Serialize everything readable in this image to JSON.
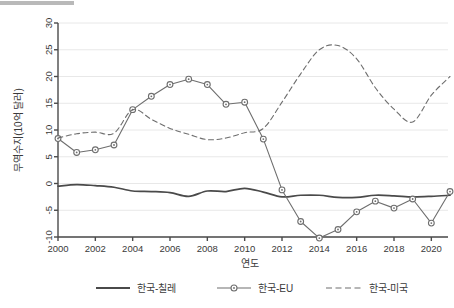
{
  "chart_data": {
    "type": "line",
    "title": "",
    "xlabel": "연도",
    "ylabel": "무역수지(10억 달러)",
    "xlim": [
      2000,
      2021
    ],
    "ylim": [
      -10,
      30
    ],
    "grid": true,
    "grid_axis": "y",
    "legend_position": "bottom",
    "x": [
      2000,
      2001,
      2002,
      2003,
      2004,
      2005,
      2006,
      2007,
      2008,
      2009,
      2010,
      2011,
      2012,
      2013,
      2014,
      2015,
      2016,
      2017,
      2018,
      2019,
      2020,
      2021
    ],
    "xticks": [
      "2000",
      "2002",
      "2004",
      "2006",
      "2008",
      "2010",
      "2012",
      "2014",
      "2016",
      "2018",
      "2020"
    ],
    "xtick_values": [
      2000,
      2002,
      2004,
      2006,
      2008,
      2010,
      2012,
      2014,
      2016,
      2018,
      2020
    ],
    "yticks": [
      "30",
      "25",
      "20",
      "15",
      "10",
      "5",
      "0",
      "-5",
      "-10"
    ],
    "ytick_values": [
      30,
      25,
      20,
      15,
      10,
      5,
      0,
      -5,
      -10
    ],
    "series": [
      {
        "name": "한국-칠레",
        "style": "solid",
        "marker": "none",
        "color": "#4a4a4a",
        "values": [
          -0.5,
          -0.2,
          -0.4,
          -0.7,
          -1.4,
          -1.5,
          -1.7,
          -2.4,
          -1.4,
          -1.5,
          -0.9,
          -1.6,
          -2.5,
          -2.2,
          -2.2,
          -2.6,
          -2.6,
          -2.2,
          -2.3,
          -2.5,
          -2.4,
          -2.2
        ]
      },
      {
        "name": "한국-EU",
        "style": "solid",
        "marker": "circle",
        "color": "#6e6e6e",
        "values": [
          8.4,
          5.8,
          6.3,
          7.2,
          13.8,
          16.3,
          18.5,
          19.5,
          18.5,
          14.8,
          15.2,
          8.3,
          -1.2,
          -7.1,
          -10.2,
          -8.6,
          -5.3,
          -3.3,
          -4.6,
          -2.9,
          -7.4,
          -1.5
        ]
      },
      {
        "name": "한국-미국",
        "style": "dashed",
        "marker": "none",
        "color": "#6e6e6e",
        "values": [
          8.5,
          9.3,
          9.6,
          9.4,
          13.8,
          12.0,
          10.3,
          9.2,
          8.2,
          8.5,
          9.5,
          10.3,
          15.2,
          20.5,
          25.0,
          25.8,
          23.3,
          17.9,
          13.9,
          11.5,
          16.5,
          20.0
        ]
      }
    ]
  },
  "legend": {
    "items": [
      {
        "label": "한국-칠레",
        "style": "solid",
        "marker": "none"
      },
      {
        "label": "한국-EU",
        "style": "solid",
        "marker": "circle"
      },
      {
        "label": "한국-미국",
        "style": "dashed",
        "marker": "none"
      }
    ]
  },
  "colors": {
    "chile_line": "#4a4a4a",
    "eu_line": "#6e6e6e",
    "usa_line": "#6e6e6e",
    "grid": "#e8e8e8",
    "axis": "#4a4a4a",
    "text": "#3a3a3a",
    "background": "#ffffff"
  }
}
